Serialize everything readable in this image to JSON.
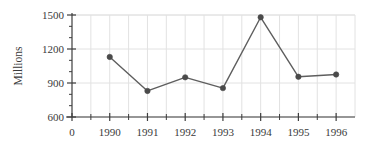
{
  "chart_data": {
    "type": "line",
    "title": "",
    "subtitle": "",
    "xlabel": "",
    "ylabel": "Millions",
    "categories": [
      "1990",
      "1991",
      "1992",
      "1993",
      "1994",
      "1995",
      "1996"
    ],
    "x": [
      1990,
      1991,
      1992,
      1993,
      1994,
      1995,
      1996
    ],
    "values": [
      1130,
      830,
      950,
      855,
      1480,
      955,
      975
    ],
    "series": [
      {
        "name": "",
        "values": [
          1130,
          830,
          950,
          855,
          1480,
          955,
          975
        ]
      }
    ],
    "xlim": [
      1989.0,
      1996.5
    ],
    "ylim": [
      600,
      1500
    ],
    "x_tick_labels": [
      "0",
      "1990",
      "1991",
      "1992",
      "1993",
      "1994",
      "1995",
      "1996"
    ],
    "x_origin_label": "0",
    "y_tick_labels": [
      "600",
      "900",
      "1200",
      "1500"
    ],
    "y_ticks": [
      600,
      900,
      1200,
      1500
    ],
    "y_minor_ticks_between": 2,
    "x_minor_ticks_between": 1,
    "grid": true,
    "grid_axis": "both",
    "legend": false,
    "legend_position": "none",
    "marker": "circle",
    "annotations": [],
    "colors": {
      "line": "#5e5e5e",
      "marker": "#4a4a4a",
      "grid": "#e2e2e2",
      "axis": "#3d3d3d",
      "text": "#3a3a3a",
      "background": "#ffffff"
    }
  }
}
